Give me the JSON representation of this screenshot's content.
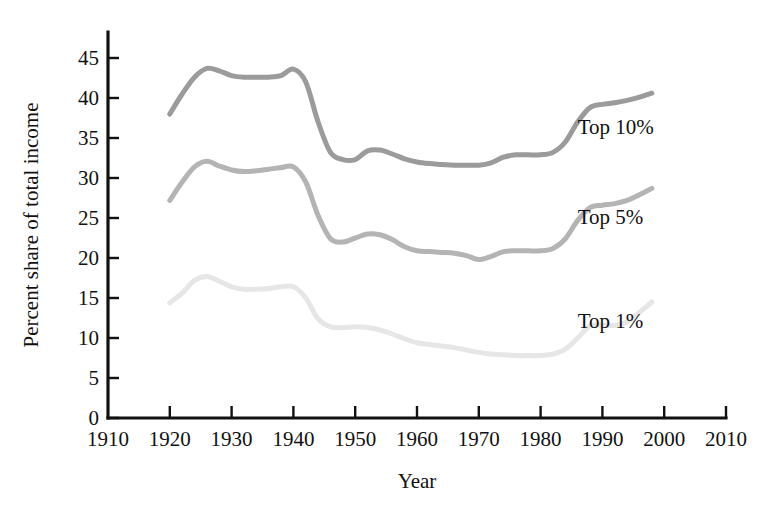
{
  "chart_data": {
    "type": "line",
    "title": "",
    "xlabel": "Year",
    "ylabel": "Percent share of total income",
    "xlim": [
      1910,
      2010
    ],
    "ylim": [
      0,
      47
    ],
    "grid": false,
    "legend_position": "inline-right",
    "x_ticks": [
      "1910",
      "1920",
      "1930",
      "1940",
      "1950",
      "1960",
      "1970",
      "1980",
      "1990",
      "2000",
      "2010"
    ],
    "y_ticks": [
      "0",
      "5",
      "10",
      "15",
      "20",
      "25",
      "30",
      "35",
      "40",
      "45"
    ],
    "x": [
      1920,
      1922,
      1924,
      1926,
      1928,
      1930,
      1932,
      1934,
      1936,
      1938,
      1940,
      1942,
      1944,
      1946,
      1948,
      1950,
      1952,
      1954,
      1956,
      1958,
      1960,
      1962,
      1964,
      1966,
      1968,
      1970,
      1972,
      1974,
      1976,
      1978,
      1980,
      1982,
      1984,
      1986,
      1988,
      1990,
      1992,
      1994,
      1996,
      1998
    ],
    "series": [
      {
        "name": "Top 10%",
        "color": "#9b9b9b",
        "label_x": 1986,
        "label_y": 35.5,
        "values": [
          38.0,
          40.5,
          42.6,
          43.7,
          43.4,
          42.8,
          42.6,
          42.6,
          42.6,
          42.8,
          43.6,
          42.0,
          37.0,
          33.2,
          32.3,
          32.3,
          33.4,
          33.5,
          33.0,
          32.4,
          32.0,
          31.8,
          31.7,
          31.6,
          31.6,
          31.6,
          31.9,
          32.6,
          32.9,
          32.9,
          32.9,
          33.2,
          34.5,
          37.0,
          38.8,
          39.2,
          39.4,
          39.7,
          40.1,
          40.6
        ]
      },
      {
        "name": "Top 5%",
        "color": "#b4b4b4",
        "label_x": 1986,
        "label_y": 24.2,
        "values": [
          27.2,
          29.5,
          31.4,
          32.1,
          31.5,
          31.0,
          30.8,
          30.9,
          31.1,
          31.3,
          31.4,
          29.5,
          25.3,
          22.4,
          22.0,
          22.5,
          23.0,
          22.9,
          22.3,
          21.4,
          20.9,
          20.8,
          20.7,
          20.6,
          20.3,
          19.8,
          20.2,
          20.8,
          20.9,
          20.9,
          20.9,
          21.2,
          22.4,
          24.7,
          26.3,
          26.6,
          26.8,
          27.2,
          27.9,
          28.7
        ]
      },
      {
        "name": "Top 1%",
        "color": "#e6e6e6",
        "label_x": 1986,
        "label_y": 11.2,
        "values": [
          14.4,
          15.6,
          17.2,
          17.7,
          17.1,
          16.4,
          16.1,
          16.1,
          16.2,
          16.4,
          16.4,
          15.0,
          12.4,
          11.4,
          11.3,
          11.4,
          11.3,
          11.0,
          10.5,
          9.9,
          9.4,
          9.2,
          9.0,
          8.8,
          8.5,
          8.2,
          8.0,
          7.9,
          7.8,
          7.8,
          7.8,
          8.0,
          8.6,
          10.0,
          11.5,
          11.6,
          11.6,
          12.0,
          13.2,
          14.5
        ]
      }
    ]
  },
  "axis": {
    "x_title": "Year",
    "y_title": "Percent share of total income"
  }
}
